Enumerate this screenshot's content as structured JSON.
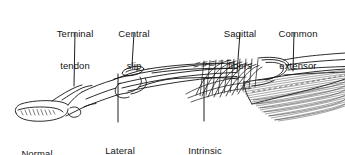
{
  "figure": {
    "background_color": "#ffffff",
    "ink_color": "#141414",
    "shade_color": "#7a7a7a",
    "width": 345,
    "height": 155
  },
  "labels": [
    {
      "id": "terminal-tendon",
      "line1": "Terminal",
      "line2": "tendon",
      "x": 75,
      "y": 8,
      "align": "center",
      "leader": {
        "x1": 75,
        "y1": 33,
        "x2": 74,
        "y2": 86
      }
    },
    {
      "id": "central-slip",
      "line1": "Central",
      "line2": "slip",
      "x": 134,
      "y": 8,
      "align": "center",
      "leader": {
        "x1": 134,
        "y1": 33,
        "x2": 132,
        "y2": 66
      }
    },
    {
      "id": "sagittal-fibers",
      "line1": "Sagittal",
      "line2": "fibers",
      "x": 240,
      "y": 8,
      "align": "center",
      "leader": {
        "x1": 240,
        "y1": 33,
        "x2": 237,
        "y2": 73
      }
    },
    {
      "id": "common-extensor",
      "line1": "Common",
      "line2": "extensor",
      "x": 298,
      "y": 8,
      "align": "center",
      "leader": {
        "x1": 294,
        "y1": 33,
        "x2": 293,
        "y2": 71
      }
    },
    {
      "id": "normal",
      "line1": "Normal",
      "line2": "",
      "x": 37,
      "y": 128,
      "align": "center",
      "leader": null
    },
    {
      "id": "lateral-band",
      "line1": "Lateral",
      "line2": "band",
      "x": 120,
      "y": 125,
      "align": "center",
      "leader": {
        "x1": 118,
        "y1": 74,
        "x2": 118,
        "y2": 122
      }
    },
    {
      "id": "intrinsic-tendon",
      "line1": "Intrinsic",
      "line2": "tendon",
      "x": 205,
      "y": 125,
      "align": "center",
      "leader": {
        "x1": 204,
        "y1": 78,
        "x2": 204,
        "y2": 121
      }
    }
  ],
  "anatomy": {
    "regions": [
      {
        "id": "distal-phalanx",
        "name": "Distal phalanx / fingertip"
      },
      {
        "id": "middle-phalanx",
        "name": "Middle phalanx"
      },
      {
        "id": "proximal-phalanx",
        "name": "Proximal phalanx"
      },
      {
        "id": "metacarpal-head",
        "name": "Metacarpal head"
      },
      {
        "id": "extensor-hood",
        "name": "Extensor hood (sagittal bands)"
      },
      {
        "id": "muscle-belly",
        "name": "Common extensor muscle belly"
      }
    ]
  }
}
